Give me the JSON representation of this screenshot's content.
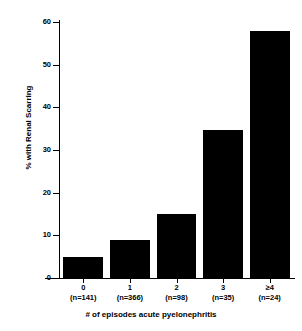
{
  "chart_data": {
    "type": "bar",
    "title": "",
    "subtitle": "",
    "xlabel": "# of episodes acute pyelonephritis",
    "ylabel": "% with Renal Scarring",
    "categories": [
      "0",
      "1",
      "2",
      "3",
      "≥4"
    ],
    "group_sizes": [
      "(n=141)",
      "(n=366)",
      "(n=98)",
      "(n=35)",
      "(n=24)"
    ],
    "values": [
      5,
      9,
      15,
      34.7,
      58
    ],
    "ylim": [
      0,
      60
    ],
    "yticks": [
      0,
      10,
      20,
      30,
      40,
      50,
      60
    ],
    "ytick_labels": [
      "0",
      "10",
      "20",
      "30",
      "40",
      "50",
      "60"
    ],
    "grid": false,
    "legend": false,
    "bar_color": "#000000",
    "axis_color": "#000000",
    "background_color": "#ffffff"
  },
  "figure": {
    "x_axis_title": "# of episodes acute pyelonephritis",
    "y_axis_title": "% with Renal Scarring"
  }
}
